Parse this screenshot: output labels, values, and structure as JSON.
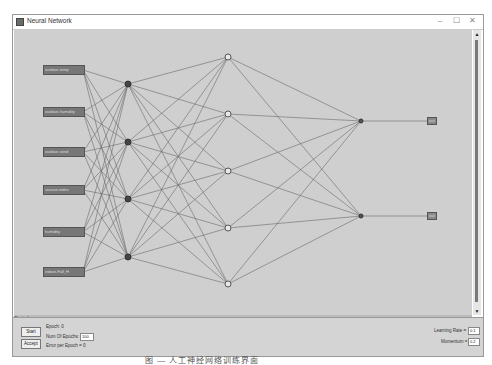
{
  "window": {
    "title": "Neural Network",
    "minimize": "–",
    "maximize": "☐",
    "close": "✕"
  },
  "network": {
    "inputs": [
      "outdoor-temp",
      "outdoor-humidity",
      "outdoor-wind",
      "season-index",
      "humidity",
      "indoor-Fall_H"
    ],
    "hidden1_count": 4,
    "hidden2_count": 5,
    "output_count": 2,
    "outputs": [
      "out",
      "out"
    ]
  },
  "controls": {
    "title": "Controls",
    "start_label": "Start",
    "accept_label": "Accept",
    "epoch_label": "Epoch: 0",
    "num_epochs_label": "Num Of Epochs:",
    "num_epochs_value": "100",
    "error_label": "Error per Epoch = 0",
    "learning_rate_label": "Learning Rate =",
    "learning_rate_value": "0.1",
    "momentum_label": "Momentum =",
    "momentum_value": "0.2"
  },
  "caption": "图 — 人工神经网络训练界面"
}
